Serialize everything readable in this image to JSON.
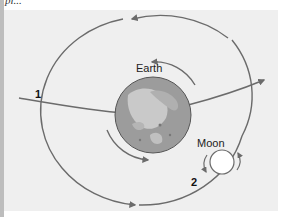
{
  "figure": {
    "caption_fragment": "pl...",
    "labels": {
      "earth": "Earth",
      "moon": "Moon",
      "path_1": "1",
      "path_2": "2"
    },
    "colors": {
      "panel_bg": "#efefef",
      "arrow": "#6b6b6b",
      "earth_ocean": "#9a9a9a",
      "earth_land": "#c8c8c8",
      "moon_fill": "#ffffff"
    }
  }
}
